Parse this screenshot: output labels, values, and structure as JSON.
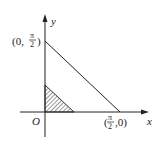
{
  "diagram": {
    "axes": {
      "x_label": "x",
      "y_label": "y",
      "origin_label": "O"
    },
    "points": {
      "y_intercept": {
        "prefix": "(0,",
        "num": "π",
        "den": "2",
        "suffix": ")"
      },
      "x_intercept": {
        "prefix": "(",
        "num": "π",
        "den": "2",
        "suffix": ",0)"
      }
    },
    "shaded_region": "small triangle near origin (hatched)",
    "line": "segment from (0, π/2) to (π/2, 0)"
  }
}
